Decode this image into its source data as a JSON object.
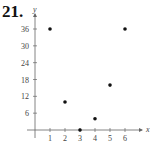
{
  "problem_number": "21.",
  "chart_data": {
    "type": "scatter",
    "title": "",
    "xlabel": "x",
    "ylabel": "y",
    "x": [
      1,
      2,
      3,
      4,
      5,
      6
    ],
    "y": [
      36,
      10,
      0,
      4,
      16,
      36
    ],
    "x_ticks": [
      "1",
      "2",
      "3",
      "4",
      "5",
      "6"
    ],
    "y_ticks": [
      "6",
      "12",
      "18",
      "24",
      "30",
      "36"
    ],
    "xlim": [
      0,
      7
    ],
    "ylim": [
      0,
      40
    ],
    "grid": false,
    "legend": null
  }
}
